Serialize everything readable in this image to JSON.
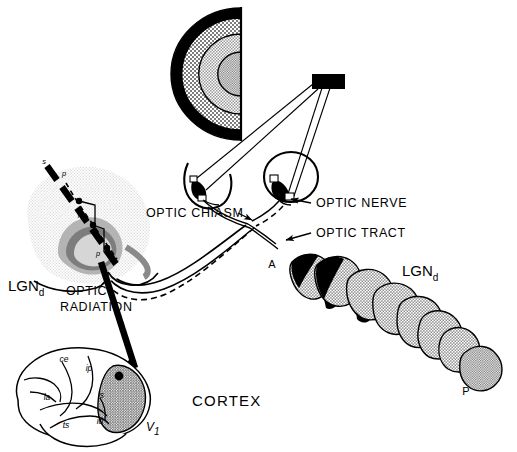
{
  "figure": {
    "background_color": "#ffffff",
    "ink_color": "#000000"
  },
  "labels": {
    "optic_chiasm": "OPTIC CHIASM",
    "optic_nerve": "OPTIC NERVE",
    "optic_tract": "OPTIC TRACT",
    "optic_radiation_line1": "OPTIC",
    "optic_radiation_line2": "RADIATION",
    "cortex": "CORTEX",
    "lgn_left_main": "LGN",
    "lgn_left_sub": "d",
    "lgn_stack_main": "LGN",
    "lgn_stack_sub": "d",
    "anterior": "A",
    "posterior": "P",
    "v1_main": "V",
    "v1_sub": "1"
  },
  "coronal_section": {
    "name": "LGNd coronal section",
    "electrode_tip_label": "s",
    "penetration_labels": [
      "p",
      "p",
      "p"
    ]
  },
  "brain": {
    "name": "lateral view of cortex",
    "sulci": [
      {
        "id": "ce",
        "label": "ce"
      },
      {
        "id": "ip",
        "label": "ip"
      },
      {
        "id": "ls",
        "label": "ls"
      },
      {
        "id": "la",
        "label": "la"
      },
      {
        "id": "ts",
        "label": "ts"
      },
      {
        "id": "io",
        "label": "io"
      }
    ],
    "v1_region_label": "V1",
    "injection_site": true
  },
  "visual_field": {
    "name": "hemifield eccentricity map",
    "zones": [
      {
        "id": "peripheral",
        "fill": "#000000"
      },
      {
        "id": "mid-peripheral",
        "fill": "#8c8c8c"
      },
      {
        "id": "parafoveal",
        "fill": "#b9b9b9"
      },
      {
        "id": "foveal",
        "fill": "#cfcfcf"
      }
    ]
  },
  "stimulus": {
    "name": "visual stimulus bar",
    "fill": "#000000"
  },
  "lgn_stack": {
    "name": "serial sections of LGNd from anterior to posterior",
    "section_count": 8,
    "body_fill": "#a8a8a8",
    "dark_fill": "#000000",
    "posterior_fill": "#9a9a9a"
  },
  "colors": {
    "black": "#000000",
    "mid_gray": "#8c8c8c",
    "light_gray": "#b9b9b9",
    "pale_gray": "#cfcfcf",
    "section_gray": "#a8a8a8",
    "tissue_gray": "#d8d8d8"
  }
}
